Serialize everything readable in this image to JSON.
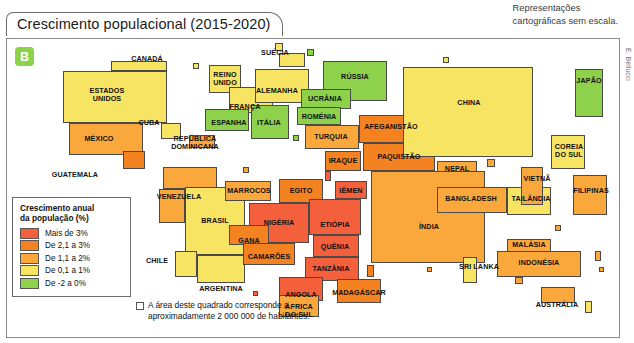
{
  "header": {
    "title": "Crescimento populacional (2015-2020)",
    "scale_note": "Representações\ncartográficas sem escala.",
    "credit": "E. Bellucci",
    "badge": "B"
  },
  "legend": {
    "title": "Crescimento anual\nda população (%)",
    "items": [
      {
        "label": "Mais de 3%",
        "color": "#f4603c"
      },
      {
        "label": "De 2,1 a 3%",
        "color": "#f58220"
      },
      {
        "label": "De 1,1 a 2%",
        "color": "#faa83c"
      },
      {
        "label": "De 0,1 a 1%",
        "color": "#f7e463"
      },
      {
        "label": "De -2 a 0%",
        "color": "#8ed14a"
      }
    ]
  },
  "note": {
    "text": "A área deste quadrado corresponde a\naproximadamente 2 000 000 de habitantes."
  },
  "chart_data": {
    "type": "map",
    "title": "Crescimento populacional (2015-2020)",
    "unit_note": "Cada quadrado ≈ 2 000 000 de habitantes",
    "classes": [
      {
        "label": "Mais de 3%",
        "color": "#f4603c"
      },
      {
        "label": "De 2,1 a 3%",
        "color": "#f58220"
      },
      {
        "label": "De 1,1 a 2%",
        "color": "#faa83c"
      },
      {
        "label": "De 0,1 a 1%",
        "color": "#f7e463"
      },
      {
        "label": "De -2 a 0%",
        "color": "#8ed14a"
      }
    ],
    "countries": [
      {
        "name": "CANADÁ",
        "class": "De 0,1 a 1%",
        "color": "#f7e463",
        "x": 104,
        "y": 22,
        "w": 56,
        "h": 10,
        "lx": 140,
        "ly": 20,
        "label_pos": "right"
      },
      {
        "name": "ESTADOS\nUNIDOS",
        "class": "De 0,1 a 1%",
        "color": "#f7e463",
        "x": 56,
        "y": 32,
        "w": 104,
        "h": 52,
        "lx": 100,
        "ly": 56
      },
      {
        "name": "MÉXICO",
        "class": "De 1,1 a 2%",
        "color": "#faa83c",
        "x": 62,
        "y": 84,
        "w": 74,
        "h": 32,
        "lx": 92,
        "ly": 100
      },
      {
        "name": "GUATEMALA",
        "class": "De 2,1 a 3%",
        "color": "#f58220",
        "x": 116,
        "y": 112,
        "w": 22,
        "h": 18,
        "lx": 68,
        "ly": 136,
        "label_pos": "left"
      },
      {
        "name": "CUBA",
        "class": "De 0,1 a 1%",
        "color": "#f7e463",
        "x": 154,
        "y": 84,
        "w": 20,
        "h": 16,
        "lx": 142,
        "ly": 84,
        "label_pos": "left"
      },
      {
        "name": "REPÚBLICA\nDOMINICANA",
        "class": "De 1,1 a 2%",
        "color": "#faa83c",
        "x": 182,
        "y": 96,
        "w": 26,
        "h": 13,
        "lx": 188,
        "ly": 104
      },
      {
        "name": "VENEZUELA",
        "class": "De 1,1 a 2%",
        "color": "#faa83c",
        "x": 156,
        "y": 128,
        "w": 54,
        "h": 22,
        "lx": 172,
        "ly": 158
      },
      {
        "name": "EQUADOR",
        "class": "De 1,1 a 2%",
        "color": "#faa83c",
        "x": 152,
        "y": 150,
        "w": 26,
        "h": 34,
        "lx": 90,
        "ly": 182,
        "label_pos": "left"
      },
      {
        "name": "BRASIL",
        "class": "De 0,1 a 1%",
        "color": "#f7e463",
        "x": 178,
        "y": 148,
        "w": 60,
        "h": 68,
        "lx": 208,
        "ly": 182
      },
      {
        "name": "CHILE",
        "class": "De 0,1 a 1%",
        "color": "#f7e463",
        "x": 168,
        "y": 212,
        "w": 22,
        "h": 26,
        "lx": 150,
        "ly": 222,
        "label_pos": "left"
      },
      {
        "name": "ARGENTINA",
        "class": "De 0,1 a 1%",
        "color": "#f7e463",
        "x": 190,
        "y": 216,
        "w": 48,
        "h": 28,
        "lx": 214,
        "ly": 250
      },
      {
        "name": "REINO\nUNIDO",
        "class": "De 0,1 a 1%",
        "color": "#f7e463",
        "x": 202,
        "y": 26,
        "w": 32,
        "h": 28,
        "lx": 218,
        "ly": 40
      },
      {
        "name": "SUÉCIA",
        "class": "De 0,1 a 1%",
        "color": "#f7e463",
        "x": 272,
        "y": 14,
        "w": 26,
        "h": 14,
        "lx": 268,
        "ly": 14,
        "label_pos": "left"
      },
      {
        "name": "FRANÇA",
        "class": "De 0,1 a 1%",
        "color": "#f7e463",
        "x": 222,
        "y": 48,
        "w": 44,
        "h": 26,
        "lx": 238,
        "ly": 68
      },
      {
        "name": "ALEMANHA",
        "class": "De 0,1 a 1%",
        "color": "#f7e463",
        "x": 248,
        "y": 30,
        "w": 54,
        "h": 34,
        "lx": 270,
        "ly": 52
      },
      {
        "name": "ESPANHA",
        "class": "De -2 a 0%",
        "color": "#8ed14a",
        "x": 198,
        "y": 70,
        "w": 44,
        "h": 22,
        "lx": 222,
        "ly": 84
      },
      {
        "name": "ITÁLIA",
        "class": "De -2 a 0%",
        "color": "#8ed14a",
        "x": 244,
        "y": 66,
        "w": 38,
        "h": 34,
        "lx": 262,
        "ly": 84
      },
      {
        "name": "RÚSSIA",
        "class": "De -2 a 0%",
        "color": "#8ed14a",
        "x": 316,
        "y": 22,
        "w": 64,
        "h": 40,
        "lx": 348,
        "ly": 38
      },
      {
        "name": "UCRÂNIA",
        "class": "De -2 a 0%",
        "color": "#8ed14a",
        "x": 294,
        "y": 50,
        "w": 50,
        "h": 20,
        "lx": 318,
        "ly": 60
      },
      {
        "name": "ROMÉNIA",
        "class": "De -2 a 0%",
        "color": "#8ed14a",
        "x": 290,
        "y": 68,
        "w": 44,
        "h": 18,
        "lx": 312,
        "ly": 78
      },
      {
        "name": "TURQUIA",
        "class": "De 1,1 a 2%",
        "color": "#faa83c",
        "x": 298,
        "y": 86,
        "w": 54,
        "h": 24,
        "lx": 324,
        "ly": 98
      },
      {
        "name": "AFEGANISTÃO",
        "class": "De 2,1 a 3%",
        "color": "#f58220",
        "x": 352,
        "y": 76,
        "w": 62,
        "h": 28,
        "lx": 384,
        "ly": 88
      },
      {
        "name": "IRAQUE",
        "class": "De 2,1 a 3%",
        "color": "#f58220",
        "x": 318,
        "y": 112,
        "w": 36,
        "h": 20,
        "lx": 336,
        "ly": 122
      },
      {
        "name": "IÊMEN",
        "class": "Mais de 3%",
        "color": "#f4603c",
        "x": 328,
        "y": 142,
        "w": 32,
        "h": 18,
        "lx": 344,
        "ly": 152
      },
      {
        "name": "PAQUISTÃO",
        "class": "De 2,1 a 3%",
        "color": "#f58220",
        "x": 356,
        "y": 104,
        "w": 72,
        "h": 28,
        "lx": 392,
        "ly": 118
      },
      {
        "name": "NEPAL",
        "class": "De 1,1 a 2%",
        "color": "#faa83c",
        "x": 430,
        "y": 122,
        "w": 40,
        "h": 16,
        "lx": 450,
        "ly": 130
      },
      {
        "name": "CHINA",
        "class": "De 0,1 a 1%",
        "color": "#f7e463",
        "x": 396,
        "y": 28,
        "w": 130,
        "h": 90,
        "lx": 462,
        "ly": 64
      },
      {
        "name": "ÍNDIA",
        "class": "De 1,1 a 2%",
        "color": "#faa83c",
        "x": 364,
        "y": 132,
        "w": 114,
        "h": 92,
        "lx": 422,
        "ly": 188
      },
      {
        "name": "BANGLADESH",
        "class": "De 1,1 a 2%",
        "color": "#faa83c",
        "x": 430,
        "y": 148,
        "w": 70,
        "h": 26,
        "lx": 464,
        "ly": 160
      },
      {
        "name": "TAILÂNDIA",
        "class": "De 0,1 a 1%",
        "color": "#f7e463",
        "x": 500,
        "y": 148,
        "w": 44,
        "h": 28,
        "lx": 524,
        "ly": 160
      },
      {
        "name": "VIETNÃ",
        "class": "De 1,1 a 2%",
        "color": "#faa83c",
        "x": 514,
        "y": 128,
        "w": 22,
        "h": 38,
        "lx": 530,
        "ly": 140
      },
      {
        "name": "COREIA\nDO SUL",
        "class": "De 0,1 a 1%",
        "color": "#f7e463",
        "x": 544,
        "y": 96,
        "w": 34,
        "h": 34,
        "lx": 562,
        "ly": 112
      },
      {
        "name": "JAPÃO",
        "class": "De -2 a 0%",
        "color": "#8ed14a",
        "x": 568,
        "y": 30,
        "w": 28,
        "h": 48,
        "lx": 582,
        "ly": 42
      },
      {
        "name": "FILIPINAS",
        "class": "De 1,1 a 2%",
        "color": "#faa83c",
        "x": 566,
        "y": 136,
        "w": 34,
        "h": 40,
        "lx": 584,
        "ly": 152
      },
      {
        "name": "MALÁSIA",
        "class": "De 1,1 a 2%",
        "color": "#faa83c",
        "x": 500,
        "y": 200,
        "w": 44,
        "h": 14,
        "lx": 522,
        "ly": 206
      },
      {
        "name": "INDONÉSIA",
        "class": "De 1,1 a 2%",
        "color": "#faa83c",
        "x": 490,
        "y": 212,
        "w": 84,
        "h": 26,
        "lx": 532,
        "ly": 224
      },
      {
        "name": "SRI LANKA",
        "class": "De 0,1 a 1%",
        "color": "#f7e463",
        "x": 456,
        "y": 218,
        "w": 14,
        "h": 26,
        "lx": 472,
        "ly": 228
      },
      {
        "name": "AUSTRÁLIA",
        "class": "De 1,1 a 2%",
        "color": "#faa83c",
        "x": 534,
        "y": 248,
        "w": 34,
        "h": 16,
        "lx": 550,
        "ly": 266
      },
      {
        "name": "MARROCOS",
        "class": "De 1,1 a 2%",
        "color": "#faa83c",
        "x": 218,
        "y": 142,
        "w": 46,
        "h": 20,
        "lx": 242,
        "ly": 152
      },
      {
        "name": "EGITO",
        "class": "De 2,1 a 3%",
        "color": "#f58220",
        "x": 272,
        "y": 140,
        "w": 44,
        "h": 24,
        "lx": 294,
        "ly": 152
      },
      {
        "name": "NIGÉRIA",
        "class": "Mais de 3%",
        "color": "#f4603c",
        "x": 242,
        "y": 164,
        "w": 60,
        "h": 40,
        "lx": 272,
        "ly": 184
      },
      {
        "name": "GANA",
        "class": "De 2,1 a 3%",
        "color": "#f58220",
        "x": 222,
        "y": 186,
        "w": 40,
        "h": 20,
        "lx": 242,
        "ly": 202
      },
      {
        "name": "CAMARÕES",
        "class": "De 2,1 a 3%",
        "color": "#f58220",
        "x": 236,
        "y": 204,
        "w": 52,
        "h": 22,
        "lx": 262,
        "ly": 218
      },
      {
        "name": "ETIÓPIA",
        "class": "Mais de 3%",
        "color": "#f4603c",
        "x": 302,
        "y": 160,
        "w": 52,
        "h": 36,
        "lx": 328,
        "ly": 186
      },
      {
        "name": "QUÊNIA",
        "class": "Mais de 3%",
        "color": "#f4603c",
        "x": 306,
        "y": 196,
        "w": 46,
        "h": 22,
        "lx": 328,
        "ly": 208
      },
      {
        "name": "TANZÂNIA",
        "class": "Mais de 3%",
        "color": "#f4603c",
        "x": 298,
        "y": 218,
        "w": 54,
        "h": 24,
        "lx": 324,
        "ly": 230
      },
      {
        "name": "ANGOLA",
        "class": "Mais de 3%",
        "color": "#f4603c",
        "x": 272,
        "y": 238,
        "w": 44,
        "h": 24,
        "lx": 294,
        "ly": 256
      },
      {
        "name": "MADAGÁSCAR",
        "class": "De 2,1 a 3%",
        "color": "#f58220",
        "x": 330,
        "y": 240,
        "w": 44,
        "h": 24,
        "lx": 352,
        "ly": 254
      },
      {
        "name": "ÁFRICA\nDO SUL",
        "class": "De 1,1 a 2%",
        "color": "#faa83c",
        "x": 272,
        "y": 256,
        "w": 40,
        "h": 22,
        "lx": 292,
        "ly": 272
      }
    ],
    "filler_blocks": [
      {
        "x": 162,
        "y": 88,
        "w": 7,
        "h": 7,
        "color": "#f7e463"
      },
      {
        "x": 186,
        "y": 24,
        "w": 6,
        "h": 6,
        "color": "#f7e463"
      },
      {
        "x": 268,
        "y": 4,
        "w": 8,
        "h": 8,
        "color": "#f7e463"
      },
      {
        "x": 300,
        "y": 10,
        "w": 7,
        "h": 7,
        "color": "#8ed14a"
      },
      {
        "x": 286,
        "y": 96,
        "w": 6,
        "h": 6,
        "color": "#8ed14a"
      },
      {
        "x": 236,
        "y": 128,
        "w": 6,
        "h": 6,
        "color": "#faa83c"
      },
      {
        "x": 200,
        "y": 160,
        "w": 5,
        "h": 5,
        "color": "#faa83c"
      },
      {
        "x": 318,
        "y": 132,
        "w": 6,
        "h": 10,
        "color": "#f4603c"
      },
      {
        "x": 360,
        "y": 226,
        "w": 7,
        "h": 12,
        "color": "#f58220"
      },
      {
        "x": 480,
        "y": 120,
        "w": 8,
        "h": 8,
        "color": "#faa83c"
      },
      {
        "x": 548,
        "y": 186,
        "w": 6,
        "h": 6,
        "color": "#faa83c"
      },
      {
        "x": 588,
        "y": 212,
        "w": 6,
        "h": 10,
        "color": "#faa83c"
      },
      {
        "x": 592,
        "y": 228,
        "w": 5,
        "h": 5,
        "color": "#faa83c"
      },
      {
        "x": 578,
        "y": 262,
        "w": 7,
        "h": 12,
        "color": "#f7e463"
      },
      {
        "x": 508,
        "y": 238,
        "w": 8,
        "h": 7,
        "color": "#faa83c"
      },
      {
        "x": 420,
        "y": 228,
        "w": 5,
        "h": 5,
        "color": "#faa83c"
      },
      {
        "x": 246,
        "y": 252,
        "w": 5,
        "h": 5,
        "color": "#f4603c"
      },
      {
        "x": 296,
        "y": 264,
        "w": 6,
        "h": 6,
        "color": "#faa83c"
      },
      {
        "x": 152,
        "y": 24,
        "w": 6,
        "h": 6,
        "color": "#f7e463"
      },
      {
        "x": 436,
        "y": 18,
        "w": 6,
        "h": 6,
        "color": "#f7e463"
      }
    ]
  }
}
